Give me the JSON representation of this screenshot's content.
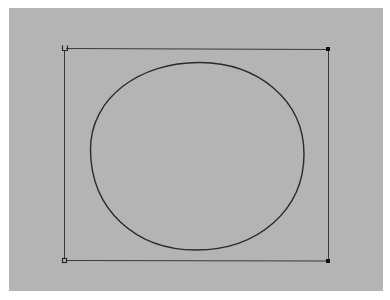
{
  "canvas": {
    "background": "#b4b4b4",
    "stroke_color": "#2a2a2a",
    "frame_color": "#3a3a3a"
  },
  "selection_frame": {
    "corners": {
      "top_left": {
        "x": 64,
        "y": 48,
        "style": "open-cup"
      },
      "top_right": {
        "x": 328,
        "y": 49,
        "style": "filled-square"
      },
      "bottom_left": {
        "x": 64,
        "y": 260,
        "style": "open-square"
      },
      "bottom_right": {
        "x": 328,
        "y": 261,
        "style": "filled-square"
      }
    }
  },
  "shape": {
    "type": "ellipse",
    "cx": 197,
    "cy": 156,
    "rx": 107,
    "ry": 94
  }
}
